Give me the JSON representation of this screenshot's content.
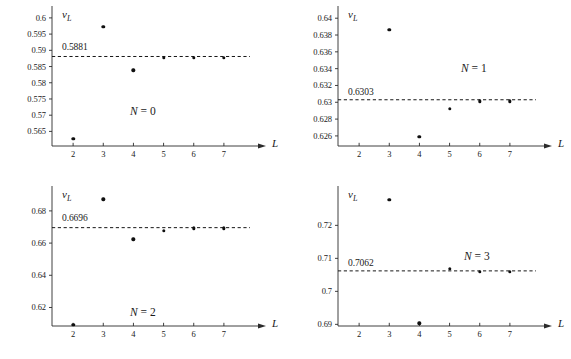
{
  "figure": {
    "panel_count": 4,
    "ink_color": "#1a1a1a",
    "point_color": "#101010"
  },
  "chart_data": [
    {
      "type": "scatter",
      "title": "N = 0",
      "tag_symbol": "N",
      "tag_value": "0",
      "xlabel": "L",
      "ylabel": "ν_L",
      "x": [
        2,
        3,
        4,
        5,
        6,
        7
      ],
      "values": [
        0.5628,
        0.5972,
        0.5838,
        0.5876,
        0.5877,
        0.5877
      ],
      "xticks": [
        2,
        3,
        4,
        5,
        6,
        7
      ],
      "xtick_labels": [
        "2",
        "3",
        "4",
        "5",
        "6",
        "7"
      ],
      "yticks": [
        0.565,
        0.57,
        0.575,
        0.58,
        0.585,
        0.59,
        0.595,
        0.6
      ],
      "ytick_labels": [
        "0.565",
        "0.57",
        "0.575",
        "0.58",
        "0.585",
        "0.59",
        "0.595",
        "0.6"
      ],
      "xlim": [
        1.3,
        7.6
      ],
      "ylim": [
        0.5605,
        0.6012
      ],
      "asymptote_value": 0.5881,
      "asymptote_label": "0.5881",
      "grid": false,
      "legend": "none"
    },
    {
      "type": "scatter",
      "title": "N = 1",
      "tag_symbol": "N",
      "tag_value": "1",
      "xlabel": "L",
      "ylabel": "ν_L",
      "x": [
        3,
        4,
        5,
        6,
        7
      ],
      "values": [
        0.6386,
        0.6259,
        0.6292,
        0.6301,
        0.6301
      ],
      "xticks": [
        2,
        3,
        4,
        5,
        6,
        7
      ],
      "xtick_labels": [
        "2",
        "3",
        "4",
        "5",
        "6",
        "7"
      ],
      "yticks": [
        0.626,
        0.628,
        0.63,
        0.632,
        0.634,
        0.636,
        0.638,
        0.64
      ],
      "ytick_labels": [
        "0.626",
        "0.628",
        "0.63",
        "0.632",
        "0.634",
        "0.636",
        "0.638",
        "0.64"
      ],
      "xlim": [
        1.3,
        7.6
      ],
      "ylim": [
        0.6248,
        0.6405
      ],
      "asymptote_value": 0.6303,
      "asymptote_label": "0.6303",
      "grid": false,
      "legend": "none"
    },
    {
      "type": "scatter",
      "title": "N = 2",
      "tag_symbol": "N",
      "tag_value": "2",
      "xlabel": "L",
      "ylabel": "ν_L",
      "x": [
        2,
        3,
        4,
        5,
        6,
        7
      ],
      "values": [
        0.6092,
        0.6872,
        0.6623,
        0.6678,
        0.6692,
        0.6692
      ],
      "xticks": [
        2,
        3,
        4,
        5,
        6,
        7
      ],
      "xtick_labels": [
        "2",
        "3",
        "4",
        "5",
        "6",
        "7"
      ],
      "yticks": [
        0.62,
        0.64,
        0.66,
        0.68
      ],
      "ytick_labels": [
        "0.62",
        "0.64",
        "0.66",
        "0.68"
      ],
      "xlim": [
        1.3,
        7.6
      ],
      "ylim": [
        0.6085,
        0.6905
      ],
      "asymptote_value": 0.6696,
      "asymptote_label": "0.6696",
      "grid": false,
      "legend": "none"
    },
    {
      "type": "scatter",
      "title": "N = 3",
      "tag_symbol": "N",
      "tag_value": "3",
      "xlabel": "L",
      "ylabel": "ν_L",
      "x": [
        3,
        4,
        5,
        6,
        7
      ],
      "values": [
        0.7278,
        0.6903,
        0.7068,
        0.7059,
        0.7059
      ],
      "xticks": [
        2,
        3,
        4,
        5,
        6,
        7
      ],
      "xtick_labels": [
        "2",
        "3",
        "4",
        "5",
        "6",
        "7"
      ],
      "yticks": [
        0.69,
        0.7,
        0.71,
        0.72
      ],
      "ytick_labels": [
        "0.69",
        "0.7",
        "0.71",
        "0.72"
      ],
      "xlim": [
        1.3,
        7.6
      ],
      "ylim": [
        0.6895,
        0.7295
      ],
      "asymptote_value": 0.7062,
      "asymptote_label": "0.7062",
      "grid": false,
      "legend": "none"
    }
  ]
}
